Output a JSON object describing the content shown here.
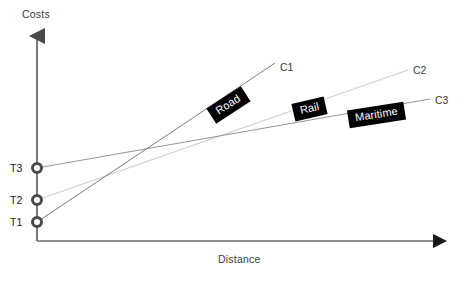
{
  "figure": {
    "type": "diagram",
    "background": "#ffffff"
  },
  "axes": {
    "y": {
      "label": "Costs",
      "x_px": 37,
      "top_px": 30,
      "bottom_px": 241,
      "color": "#6b6b6b",
      "arrow": "up"
    },
    "x": {
      "label": "Distance",
      "y_px": 241,
      "left_px": 37,
      "right_px": 447,
      "color": "#6b6b6b",
      "arrow": "right"
    }
  },
  "tiers": [
    {
      "id": "T3",
      "label": "T3",
      "x_px": 37,
      "y_px": 168,
      "label_x_px": 10,
      "label_y_px": 162
    },
    {
      "id": "T2",
      "label": "T2",
      "x_px": 37,
      "y_px": 200,
      "label_x_px": 10,
      "label_y_px": 194
    },
    {
      "id": "T1",
      "label": "T1",
      "x_px": 37,
      "y_px": 222,
      "label_x_px": 10,
      "label_y_px": 216
    }
  ],
  "curves": [
    {
      "id": "C1",
      "mode": "Road",
      "end_label": "C1",
      "start_tier": "T1",
      "color": "#7a7a7a",
      "x1": 37,
      "y1": 222,
      "x2": 275,
      "y2": 63,
      "label_x_px": 280,
      "label_y_px": 61,
      "tag_x_px": 228,
      "tag_y_px": 104,
      "tag_rotate_deg": -33
    },
    {
      "id": "C2",
      "mode": "Rail",
      "end_label": "C2",
      "start_tier": "T2",
      "color": "#cfcfcf",
      "x1": 37,
      "y1": 200,
      "x2": 408,
      "y2": 70,
      "label_x_px": 413,
      "label_y_px": 64,
      "tag_x_px": 308,
      "tag_y_px": 108,
      "tag_rotate_deg": -13
    },
    {
      "id": "C3",
      "mode": "Maritime",
      "end_label": "C3",
      "start_tier": "T3",
      "color": "#8a8a8a",
      "x1": 37,
      "y1": 168,
      "x2": 430,
      "y2": 99,
      "label_x_px": 435,
      "label_y_px": 94,
      "tag_x_px": 378,
      "tag_y_px": 115,
      "tag_rotate_deg": -9
    }
  ],
  "marker_style": {
    "radius": 5,
    "fill": "#ffffff",
    "stroke": "#4a4a4a",
    "stroke_width": 3
  }
}
